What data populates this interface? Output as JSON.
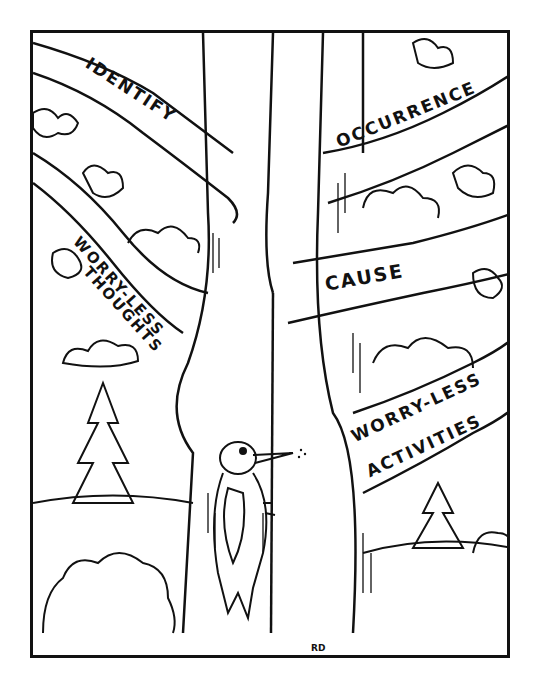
{
  "illustration": {
    "style": "black-and-white pen-and-ink cartoon",
    "description": "A tree whose branches are labeled as steps; a woodpecker pecks at the trunk",
    "branches": [
      {
        "id": "identify",
        "label": "IDENTIFY",
        "side": "left",
        "position": "upper"
      },
      {
        "id": "worry-less-thoughts",
        "label_line1": "WORRY-LESS",
        "label_line2": "THOUGHTS",
        "side": "left",
        "position": "middle"
      },
      {
        "id": "occurrence",
        "label": "OCCURRENCE",
        "side": "right",
        "position": "upper"
      },
      {
        "id": "cause",
        "label": "CAUSE",
        "side": "right",
        "position": "middle"
      },
      {
        "id": "worry-less-activities",
        "label_line1": "WORRY-LESS",
        "label_line2": "ACTIVITIES",
        "side": "right",
        "position": "lower"
      }
    ],
    "signature": "RD",
    "colors": {
      "ink": "#111111",
      "paper": "#ffffff"
    }
  }
}
